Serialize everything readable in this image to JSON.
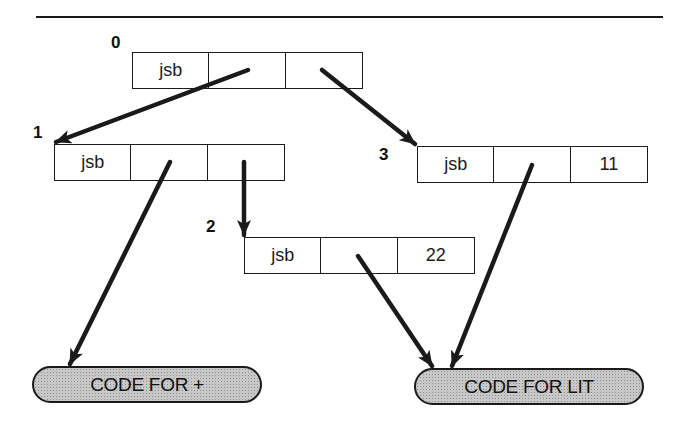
{
  "diagram": {
    "title_rule": true,
    "nodes": [
      {
        "id": "0",
        "label": "0",
        "cells": [
          "jsb",
          "",
          ""
        ]
      },
      {
        "id": "1",
        "label": "1",
        "cells": [
          "jsb",
          "",
          ""
        ]
      },
      {
        "id": "2",
        "label": "2",
        "cells": [
          "jsb",
          "",
          "22"
        ]
      },
      {
        "id": "3",
        "label": "3",
        "cells": [
          "jsb",
          "",
          "11"
        ]
      }
    ],
    "code_blocks": [
      {
        "id": "code-plus",
        "label": "CODE FOR +"
      },
      {
        "id": "code-lit",
        "label": "CODE FOR LIT"
      }
    ],
    "edges": [
      {
        "from": "0.cell2",
        "to": "1"
      },
      {
        "from": "0.cell3",
        "to": "3"
      },
      {
        "from": "1.cell2",
        "to": "code-plus"
      },
      {
        "from": "1.cell3",
        "to": "2"
      },
      {
        "from": "2.cell2",
        "to": "code-lit"
      },
      {
        "from": "3.cell2",
        "to": "code-lit"
      }
    ],
    "colors": {
      "stroke": "#1a1a1a",
      "code_block_fill": "#c8c8c8",
      "background": "#ffffff"
    }
  }
}
